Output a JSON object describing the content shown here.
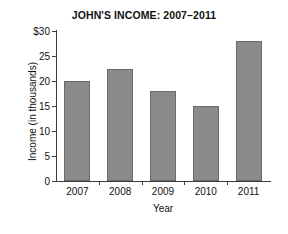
{
  "chart_data": {
    "type": "bar",
    "title": "JOHN'S INCOME: 2007–2011",
    "xlabel": "Year",
    "ylabel": "Income  (in thousands)",
    "categories": [
      "2007",
      "2008",
      "2009",
      "2010",
      "2011"
    ],
    "values": [
      20,
      22.5,
      18,
      15,
      28
    ],
    "ylim": [
      0,
      30
    ],
    "ytick_values": [
      30,
      25,
      20,
      15,
      10,
      5,
      0
    ],
    "ytick_labels": [
      "$30",
      "25",
      "20",
      "15",
      "10",
      "5",
      "0"
    ],
    "grid": false,
    "legend": null,
    "series": [
      {
        "name": "Income",
        "values": [
          20,
          22.5,
          18,
          15,
          28
        ],
        "color": "#8a8a8a"
      }
    ],
    "colors": {
      "bar_fill": "#8a8a8a",
      "bar_stroke": "#6a6a6a",
      "axis": "#3b3b3b",
      "text": "#111111",
      "background": "#ffffff"
    }
  }
}
